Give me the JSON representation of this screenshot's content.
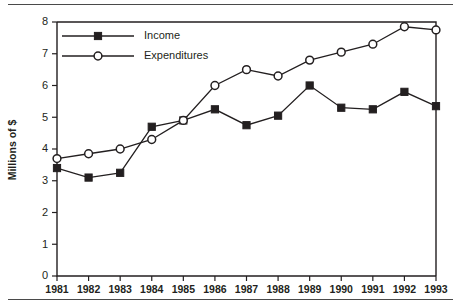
{
  "figure": {
    "title_remnant": "",
    "y_axis_title": "Millions of $",
    "legend": [
      {
        "label": "Income",
        "marker": "filled-square-marker"
      },
      {
        "label": "Expenditures",
        "marker": "open-circle-marker"
      }
    ],
    "y_tick_labels": [
      "0",
      "1",
      "2",
      "3",
      "4",
      "5",
      "6",
      "7",
      "8"
    ],
    "x_tick_labels": [
      "1981",
      "1982",
      "1983",
      "1984",
      "1985",
      "1986",
      "1987",
      "1988",
      "1989",
      "1990",
      "1991",
      "1992",
      "1993"
    ],
    "colors": {
      "ink": "#231f20",
      "background": "#ffffff",
      "rule": "#4a4a4a"
    }
  },
  "chart_data": {
    "type": "line",
    "title": "",
    "xlabel": "",
    "ylabel": "Millions of $",
    "categories": [
      "1981",
      "1982",
      "1983",
      "1984",
      "1985",
      "1986",
      "1987",
      "1988",
      "1989",
      "1990",
      "1991",
      "1992",
      "1993"
    ],
    "x": [
      1981,
      1982,
      1983,
      1984,
      1985,
      1986,
      1987,
      1988,
      1989,
      1990,
      1991,
      1992,
      1993
    ],
    "series": [
      {
        "name": "Income",
        "marker": "filled-square",
        "values": [
          3.4,
          3.1,
          3.25,
          4.7,
          4.9,
          5.25,
          4.75,
          5.05,
          6.0,
          5.3,
          5.25,
          5.8,
          5.35
        ]
      },
      {
        "name": "Expenditures",
        "marker": "open-circle",
        "values": [
          3.7,
          3.85,
          4.0,
          4.3,
          4.9,
          6.0,
          6.5,
          6.3,
          6.8,
          7.05,
          7.3,
          7.85,
          7.75
        ]
      }
    ],
    "ylim": [
      0,
      8
    ],
    "ytick_step": 1,
    "grid": false,
    "legend_position": "top-left"
  }
}
